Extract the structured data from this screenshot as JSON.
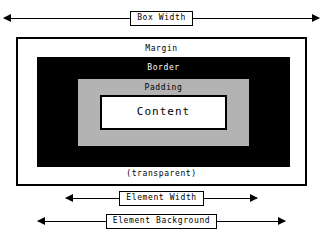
{
  "diagram": {
    "colors": {
      "background": "#ffffff",
      "stroke": "#000000",
      "margin_fill": "#ffffff",
      "border_fill": "#000000",
      "padding_fill": "#b3b3b3",
      "content_fill": "#ffffff",
      "border_label_text": "#ffffff"
    },
    "measures": [
      {
        "id": "box-width",
        "label": "Box Width",
        "position": "top",
        "arrows": "both"
      },
      {
        "id": "element-width",
        "label": "Element Width",
        "position": "bottom",
        "arrows": "both"
      },
      {
        "id": "element-background",
        "label": "Element Background",
        "position": "bottom",
        "arrows": "both"
      }
    ],
    "boxes": [
      {
        "id": "margin",
        "label": "Margin",
        "fill": "#ffffff",
        "outlined": true
      },
      {
        "id": "border",
        "label": "Border",
        "fill": "#000000",
        "outlined": false
      },
      {
        "id": "padding",
        "label": "Padding",
        "fill": "#b3b3b3",
        "outlined": false
      },
      {
        "id": "content",
        "label": "Content",
        "fill": "#ffffff",
        "outlined": true
      }
    ],
    "notes": {
      "transparent": "(transparent)"
    }
  }
}
